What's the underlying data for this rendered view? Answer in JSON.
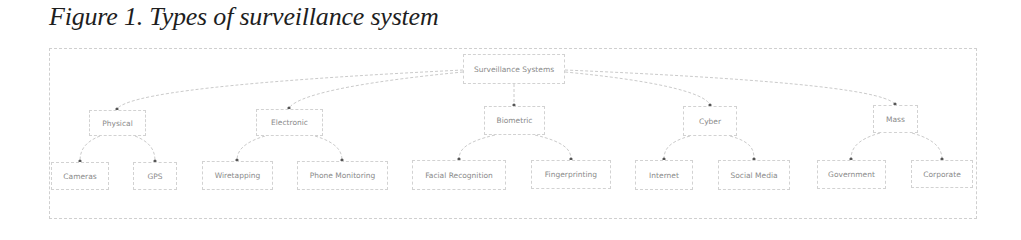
{
  "figure": {
    "caption": "Figure 1. Types of surveillance system"
  },
  "diagram": {
    "type": "tree",
    "root": {
      "id": "root",
      "label": "Surveillance Systems"
    },
    "categories": [
      {
        "id": "physical",
        "label": "Physical",
        "children": [
          {
            "id": "cameras",
            "label": "Cameras"
          },
          {
            "id": "gps",
            "label": "GPS"
          }
        ]
      },
      {
        "id": "electronic",
        "label": "Electronic",
        "children": [
          {
            "id": "wiretapping",
            "label": "Wiretapping"
          },
          {
            "id": "phone",
            "label": "Phone Monitoring"
          }
        ]
      },
      {
        "id": "biometric",
        "label": "Biometric",
        "children": [
          {
            "id": "facial",
            "label": "Facial Recognition"
          },
          {
            "id": "fingerprinting",
            "label": "Fingerprinting"
          }
        ]
      },
      {
        "id": "cyber",
        "label": "Cyber",
        "children": [
          {
            "id": "internet",
            "label": "Internet"
          },
          {
            "id": "social",
            "label": "Social Media"
          }
        ]
      },
      {
        "id": "mass",
        "label": "Mass",
        "children": [
          {
            "id": "government",
            "label": "Government"
          },
          {
            "id": "corporate",
            "label": "Corporate"
          }
        ]
      }
    ]
  },
  "colors": {
    "edge": "#c4c4c4",
    "node_border": "#d2d2d2",
    "node_text": "#8a8a8a",
    "arrow_dot": "#555555"
  }
}
